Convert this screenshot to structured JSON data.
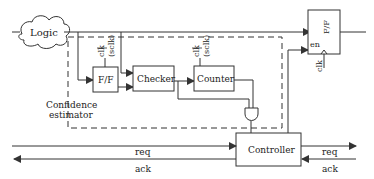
{
  "diagram": {
    "logic_label": "Logic",
    "ff_left_label": "F/F",
    "checker_label": "Checker",
    "counter_label": "Counter",
    "controller_label": "Controller",
    "ff_right_label": "F/F",
    "en_label": "en",
    "clk_label": "clk",
    "sclk_label": "(sclk)",
    "confidence_line1": "Confidence",
    "confidence_line2": "estimator",
    "req_left": "req",
    "ack_left": "ack",
    "req_right": "req",
    "ack_right": "ack",
    "colors": {
      "stroke": "#333333",
      "background": "#ffffff"
    }
  }
}
